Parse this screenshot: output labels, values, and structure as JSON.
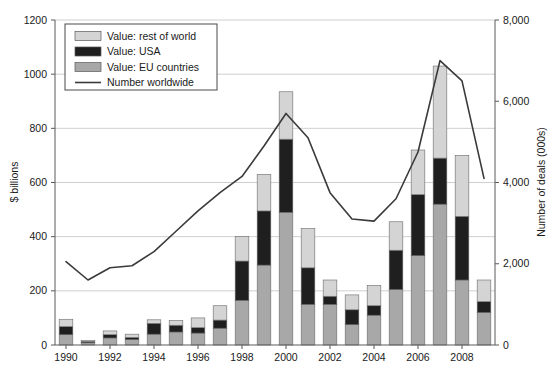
{
  "chart_data": {
    "type": "bar",
    "title": "",
    "subtitle": "",
    "xlabel": "",
    "ylabel": "$ billions",
    "y2label": "Number of deals (000s)",
    "grid": true,
    "legend_position": "top-left",
    "x": [
      1990,
      1991,
      1992,
      1993,
      1994,
      1995,
      1996,
      1997,
      1998,
      1999,
      2000,
      2001,
      2002,
      2003,
      2004,
      2005,
      2006,
      2007,
      2008,
      2009
    ],
    "categories": [
      "1990",
      "1991",
      "1992",
      "1993",
      "1994",
      "1995",
      "1996",
      "1997",
      "1998",
      "1999",
      "2000",
      "2001",
      "2002",
      "2003",
      "2004",
      "2005",
      "2006",
      "2007",
      "2008",
      "2009"
    ],
    "xtick_labels": [
      "1990",
      "1992",
      "1994",
      "1996",
      "1998",
      "2000",
      "2002",
      "2004",
      "2006",
      "2008"
    ],
    "xtick_values": [
      1990,
      1992,
      1994,
      1996,
      1998,
      2000,
      2002,
      2004,
      2006,
      2008
    ],
    "ylim": [
      0,
      1200
    ],
    "ytick_labels": [
      "0",
      "200",
      "400",
      "600",
      "800",
      "1000",
      "1200"
    ],
    "ytick_values": [
      0,
      200,
      400,
      600,
      800,
      1000,
      1200
    ],
    "y2lim": [
      0,
      8000
    ],
    "y2tick_labels": [
      "0",
      "2,000",
      "4,000",
      "6,000",
      "8,000"
    ],
    "y2tick_values": [
      0,
      2000,
      4000,
      6000,
      8000
    ],
    "stacked": true,
    "stack_order": [
      "EU countries",
      "USA",
      "rest of world"
    ],
    "series": [
      {
        "name": "Value: EU countries",
        "axis": "left",
        "color": "#a8a8a8",
        "values": [
          38,
          8,
          26,
          20,
          40,
          48,
          44,
          62,
          165,
          295,
          490,
          150,
          150,
          75,
          110,
          205,
          330,
          520,
          240,
          120
        ]
      },
      {
        "name": "Value: USA",
        "axis": "left",
        "color": "#1f1f1f",
        "values": [
          30,
          5,
          12,
          8,
          40,
          25,
          20,
          30,
          145,
          200,
          270,
          135,
          30,
          55,
          35,
          145,
          225,
          170,
          235,
          40
        ]
      },
      {
        "name": "Value: rest of world",
        "axis": "left",
        "color": "#d4d4d4",
        "values": [
          27,
          4,
          14,
          12,
          13,
          17,
          36,
          53,
          90,
          135,
          175,
          145,
          60,
          55,
          75,
          105,
          165,
          340,
          225,
          80
        ]
      },
      {
        "name": "Number worldwide",
        "axis": "right",
        "type": "line",
        "color": "#3a3a3a",
        "values": [
          2050,
          1600,
          1900,
          1950,
          2300,
          2800,
          3300,
          3750,
          4150,
          4900,
          5700,
          5100,
          3750,
          3100,
          3050,
          3600,
          4750,
          7000,
          6500,
          4100
        ]
      }
    ],
    "series_totals": [
      95,
      17,
      52,
      40,
      93,
      90,
      100,
      145,
      400,
      630,
      935,
      430,
      240,
      185,
      220,
      455,
      720,
      1030,
      700,
      240
    ]
  },
  "legend": {
    "entries": [
      {
        "label": "Value: rest of world",
        "swatch": "#d4d4d4",
        "kind": "swatch"
      },
      {
        "label": "Value: USA",
        "swatch": "#1f1f1f",
        "kind": "swatch"
      },
      {
        "label": "Value: EU countries",
        "swatch": "#a8a8a8",
        "kind": "swatch"
      },
      {
        "label": "Number worldwide",
        "swatch": "#3a3a3a",
        "kind": "line"
      }
    ]
  }
}
